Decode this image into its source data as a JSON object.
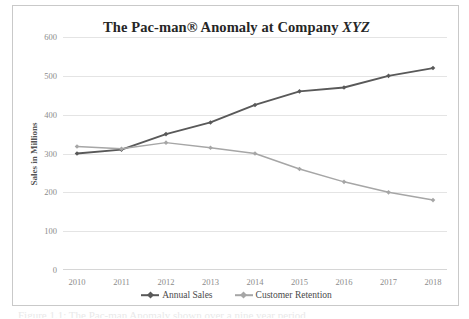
{
  "figure": {
    "caption_sliver": "Figure 1.1: The Pac-man Anomaly shown over a nine year period"
  },
  "chart_data": {
    "type": "line",
    "title_prefix": "The Pac-man® Anomaly at Company ",
    "title_italic": "XYZ",
    "title_full": "The Pac-man® Anomaly at Company XYZ",
    "xlabel": "",
    "ylabel": "Sales in Millions",
    "categories": [
      "2010",
      "2011",
      "2012",
      "2013",
      "2014",
      "2015",
      "2016",
      "2017",
      "2018"
    ],
    "yticks": [
      "600",
      "500",
      "400",
      "300",
      "200",
      "100",
      "0"
    ],
    "ylim": [
      0,
      600
    ],
    "grid": true,
    "legend_position": "bottom",
    "series": [
      {
        "name": "Annual Sales",
        "color": "#595959",
        "marker": "diamond",
        "values": [
          300,
          310,
          350,
          380,
          425,
          460,
          470,
          500,
          520
        ]
      },
      {
        "name": "Customer Retention",
        "color": "#a6a6a6",
        "marker": "diamond",
        "values": [
          318,
          312,
          328,
          315,
          300,
          260,
          227,
          200,
          180
        ]
      }
    ]
  }
}
